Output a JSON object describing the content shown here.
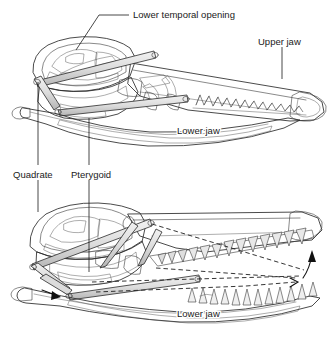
{
  "figure": {
    "background_color": "#ffffff",
    "ink_color": "#1a1a1a",
    "fill_light": "#e4e4e4",
    "fill_mid": "#c9c9c9",
    "fill_dark": "#a8a8a8",
    "fill_darkest": "#8f8f8f"
  },
  "labels": {
    "lower_temporal_opening": "Lower temporal opening",
    "upper_jaw": "Upper jaw",
    "lower_jaw_top": "Lower jaw",
    "quadrate": "Quadrate",
    "pterygoid": "Pterygoid",
    "lower_jaw_bottom": "Lower jaw"
  },
  "panels": [
    {
      "id": "upper-skull",
      "name": "Skull resting position",
      "callouts": [
        "Lower temporal opening",
        "Upper jaw",
        "Lower jaw"
      ]
    },
    {
      "id": "lower-skull",
      "name": "Skull protracted position",
      "callouts": [
        "Quadrate",
        "Pterygoid",
        "Lower jaw"
      ],
      "motion_indicators": [
        "dashed outline of resting position",
        "curved arrow showing jaw rotation",
        "straight arrow showing jaw protraction"
      ]
    }
  ]
}
